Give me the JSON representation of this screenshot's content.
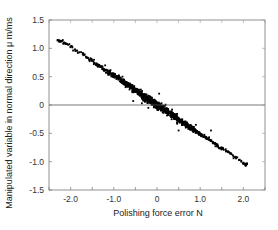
{
  "chart_data": {
    "type": "scatter",
    "title": "",
    "xlabel": "Polishing force error  N",
    "ylabel": "Manipulated variable in normal direction   μ m/ms",
    "xlim": [
      -2.5,
      2.5
    ],
    "ylim": [
      -1.5,
      1.5
    ],
    "xticks": [
      -2.0,
      -1.0,
      0,
      1.0,
      2.0
    ],
    "xtick_labels": [
      "-2.0",
      "-1.0",
      "0",
      "1.0",
      "2.0"
    ],
    "xminor_ticks": [
      -2.5,
      -1.5,
      -0.5,
      0.5,
      1.5,
      2.5
    ],
    "yticks": [
      -1.5,
      -1.0,
      -0.5,
      0,
      0.5,
      1.0,
      1.5
    ],
    "ytick_labels": [
      "-1.5",
      "-1.0",
      "-0.5",
      "0",
      "0.5",
      "1.0",
      "1.5"
    ],
    "grid": false,
    "legend": "none",
    "zero_line": true,
    "series": [
      {
        "name": "samples",
        "color": "#000000",
        "relationship": "linear, negative slope",
        "fit": {
          "slope": -0.51,
          "intercept": 0.0
        },
        "x_range": [
          -2.3,
          2.08
        ],
        "density": "dense band, thickest near x=0; sparse at ends",
        "points": [
          [
            -2.3,
            1.14
          ],
          [
            -2.25,
            1.12
          ],
          [
            -2.2,
            1.13
          ],
          [
            -2.15,
            1.1
          ],
          [
            -2.1,
            1.08
          ],
          [
            -2.0,
            1.03
          ],
          [
            -1.9,
            0.98
          ],
          [
            -1.8,
            0.93
          ],
          [
            -1.7,
            0.88
          ],
          [
            -1.6,
            0.83
          ],
          [
            -1.5,
            0.78
          ],
          [
            -1.4,
            0.72
          ],
          [
            -1.3,
            0.67
          ],
          [
            -1.2,
            0.62
          ],
          [
            -1.1,
            0.57
          ],
          [
            -1.0,
            0.52
          ],
          [
            -0.9,
            0.47
          ],
          [
            -0.8,
            0.42
          ],
          [
            -0.7,
            0.36
          ],
          [
            -0.6,
            0.31
          ],
          [
            -0.5,
            0.26
          ],
          [
            -0.4,
            0.2
          ],
          [
            -0.3,
            0.15
          ],
          [
            -0.2,
            0.1
          ],
          [
            -0.1,
            0.05
          ],
          [
            0.0,
            0.0
          ],
          [
            0.1,
            -0.05
          ],
          [
            0.2,
            -0.1
          ],
          [
            0.3,
            -0.15
          ],
          [
            0.4,
            -0.2
          ],
          [
            0.5,
            -0.26
          ],
          [
            0.6,
            -0.31
          ],
          [
            0.7,
            -0.36
          ],
          [
            0.8,
            -0.41
          ],
          [
            0.9,
            -0.46
          ],
          [
            1.0,
            -0.51
          ],
          [
            1.1,
            -0.56
          ],
          [
            1.2,
            -0.61
          ],
          [
            1.3,
            -0.66
          ],
          [
            1.4,
            -0.72
          ],
          [
            1.5,
            -0.77
          ],
          [
            1.6,
            -0.81
          ],
          [
            1.7,
            -0.86
          ],
          [
            1.8,
            -0.92
          ],
          [
            1.9,
            -0.97
          ],
          [
            2.0,
            -1.02
          ],
          [
            2.05,
            -1.05
          ],
          [
            2.08,
            -1.03
          ]
        ],
        "outliers": [
          [
            -0.55,
            0.07
          ],
          [
            -0.35,
            0.03
          ],
          [
            -0.2,
            -0.05
          ],
          [
            0.05,
            0.2
          ],
          [
            0.35,
            -0.08
          ],
          [
            0.5,
            -0.45
          ],
          [
            0.9,
            -0.35
          ],
          [
            1.25,
            -0.45
          ],
          [
            -0.8,
            0.5
          ],
          [
            -1.2,
            0.7
          ]
        ]
      }
    ]
  }
}
